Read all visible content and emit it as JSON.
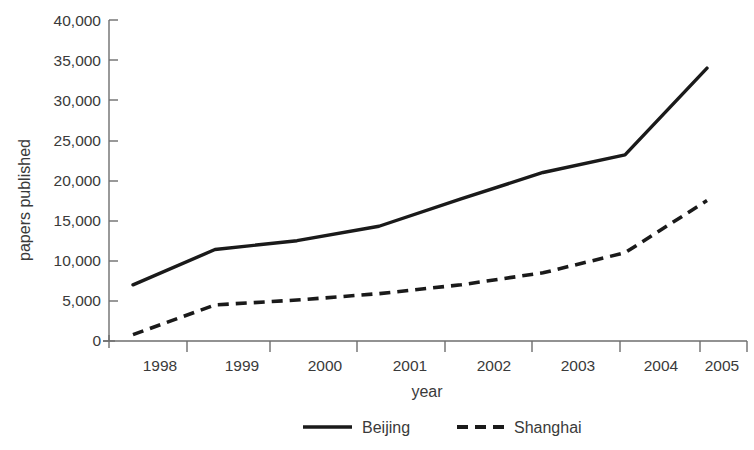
{
  "chart_data": {
    "type": "line",
    "title": "",
    "subtitle": "",
    "xlabel": "year",
    "ylabel": "papers published",
    "x": [
      1998,
      1999,
      2000,
      2001,
      2002,
      2003,
      2004,
      2005
    ],
    "xtick_labels": [
      "1998",
      "1999",
      "2000",
      "2001",
      "2002",
      "2003",
      "2004",
      "2005"
    ],
    "ytick_labels": [
      "0",
      "5,000",
      "10,000",
      "15,000",
      "20,000",
      "25,000",
      "30,000",
      "35,000",
      "40,000"
    ],
    "ytick_values": [
      0,
      5000,
      10000,
      15000,
      20000,
      25000,
      30000,
      35000,
      40000
    ],
    "ylim": [
      0,
      40000
    ],
    "xlim": [
      1998,
      2005
    ],
    "grid": false,
    "legend_position": "bottom-center",
    "series": [
      {
        "name": "Beijing",
        "style": "solid",
        "color": "#1a1a1a",
        "values": [
          7000,
          11400,
          12500,
          14300,
          17700,
          21000,
          23200,
          34000
        ]
      },
      {
        "name": "Shanghai",
        "style": "dashed",
        "color": "#1a1a1a",
        "values": [
          800,
          4500,
          5100,
          5900,
          7000,
          8500,
          11000,
          17500
        ]
      }
    ],
    "annotations": []
  },
  "legend": {
    "items": [
      {
        "label": "Beijing"
      },
      {
        "label": "Shanghai"
      }
    ]
  },
  "axes": {
    "y_axis_title": "papers published",
    "x_axis_title": "year"
  }
}
